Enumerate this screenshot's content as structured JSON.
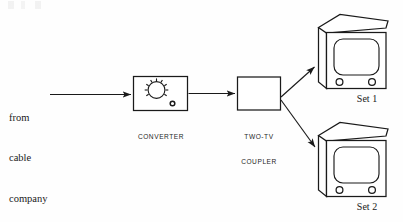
{
  "diagram": {
    "type": "block-flow-diagram",
    "stroke_color": "#1a1a1a",
    "background_color": "#fefefe"
  },
  "source_label": {
    "line1": "from",
    "line2": "cable",
    "line3": "company"
  },
  "converter": {
    "label_line1": "CONVERTER",
    "icon": "tuning-dial-icon"
  },
  "coupler": {
    "label_line1": "TWO-TV",
    "label_line2": "COUPLER"
  },
  "sets": [
    {
      "label": "Set 1",
      "icon": "television-set-icon"
    },
    {
      "label": "Set 2",
      "icon": "television-set-icon"
    }
  ],
  "connections": [
    {
      "name": "cable-to-converter",
      "from": "cable company",
      "to": "CONVERTER"
    },
    {
      "name": "converter-to-coupler",
      "from": "CONVERTER",
      "to": "TWO-TV COUPLER"
    },
    {
      "name": "coupler-to-set-1",
      "from": "TWO-TV COUPLER",
      "to": "Set 1"
    },
    {
      "name": "coupler-to-set-2",
      "from": "TWO-TV COUPLER",
      "to": "Set 2"
    }
  ]
}
